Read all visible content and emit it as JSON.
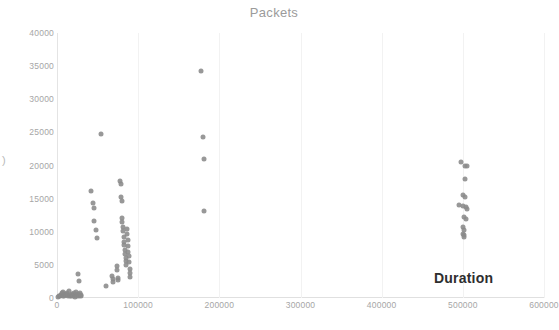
{
  "title": "Packets",
  "top_ghost": {
    "fragment_left": "",
    "fragment_right": ""
  },
  "stray_glyph": ")",
  "axis_title_x": "Duration",
  "colors": {
    "point": "#8a8a8a",
    "gridline": "#f2f2f2",
    "axis": "#e0e0e0",
    "tick_label": "#a6a6a6",
    "title": "#9b9b9b",
    "axis_title": "#2e2e2e"
  },
  "y_ticks": [
    "0",
    "5000",
    "10000",
    "15000",
    "20000",
    "25000",
    "30000",
    "35000",
    "40000"
  ],
  "x_ticks": [
    "0",
    "100000",
    "200000",
    "300000",
    "400000",
    "500000",
    "600000"
  ],
  "chart_data": {
    "type": "scatter",
    "title": "Packets",
    "xlabel": "Duration",
    "ylabel": "",
    "xlim": [
      0,
      600000
    ],
    "ylim": [
      0,
      40000
    ],
    "xticks": [
      0,
      100000,
      200000,
      300000,
      400000,
      500000,
      600000
    ],
    "yticks": [
      0,
      5000,
      10000,
      15000,
      20000,
      25000,
      30000,
      35000,
      40000
    ],
    "grid": "vertical-only",
    "legend": "none",
    "series": [
      {
        "name": "Packets vs Duration",
        "marker": "circle",
        "color": "#8a8a8a",
        "points": [
          [
            1000,
            200
          ],
          [
            2500,
            300
          ],
          [
            3500,
            250
          ],
          [
            4500,
            500
          ],
          [
            5500,
            400
          ],
          [
            6500,
            700
          ],
          [
            7500,
            350
          ],
          [
            8000,
            900
          ],
          [
            9000,
            250
          ],
          [
            10000,
            600
          ],
          [
            11000,
            400
          ],
          [
            12000,
            800
          ],
          [
            13000,
            300
          ],
          [
            14000,
            500
          ],
          [
            15000,
            1100
          ],
          [
            16000,
            350
          ],
          [
            17000,
            250
          ],
          [
            18000,
            450
          ],
          [
            19000,
            600
          ],
          [
            20000,
            300
          ],
          [
            21000,
            700
          ],
          [
            22000,
            200
          ],
          [
            23000,
            400
          ],
          [
            24000,
            900
          ],
          [
            25000,
            350
          ],
          [
            26000,
            550
          ],
          [
            27000,
            250
          ],
          [
            28000,
            800
          ],
          [
            29000,
            300
          ],
          [
            30000,
            450
          ],
          [
            26000,
            3600
          ],
          [
            27500,
            2600
          ],
          [
            42000,
            16200
          ],
          [
            44000,
            14300
          ],
          [
            45500,
            13600
          ],
          [
            46000,
            11600
          ],
          [
            47500,
            10200
          ],
          [
            49000,
            9000
          ],
          [
            54000,
            24800
          ],
          [
            60000,
            1800
          ],
          [
            68000,
            3300
          ],
          [
            68500,
            2900
          ],
          [
            69000,
            2400
          ],
          [
            74000,
            4800
          ],
          [
            74500,
            4200
          ],
          [
            75000,
            3000
          ],
          [
            75500,
            2700
          ],
          [
            78000,
            17600
          ],
          [
            78500,
            17200
          ],
          [
            79000,
            15300
          ],
          [
            79500,
            14700
          ],
          [
            80000,
            12100
          ],
          [
            80500,
            11500
          ],
          [
            81000,
            10700
          ],
          [
            81500,
            10100
          ],
          [
            82000,
            9200
          ],
          [
            82500,
            8500
          ],
          [
            83000,
            8000
          ],
          [
            83500,
            7300
          ],
          [
            84000,
            6700
          ],
          [
            84500,
            6100
          ],
          [
            85000,
            5600
          ],
          [
            85500,
            5000
          ],
          [
            86000,
            10400
          ],
          [
            86500,
            9600
          ],
          [
            87000,
            8800
          ],
          [
            87500,
            7800
          ],
          [
            88000,
            7000
          ],
          [
            88500,
            6400
          ],
          [
            89000,
            5400
          ],
          [
            89500,
            4400
          ],
          [
            90000,
            3700
          ],
          [
            90500,
            3200
          ],
          [
            178000,
            34300
          ],
          [
            180000,
            24300
          ],
          [
            180500,
            21000
          ],
          [
            181000,
            13200
          ],
          [
            498000,
            20500
          ],
          [
            503000,
            20000
          ],
          [
            505500,
            19900
          ],
          [
            503000,
            17900
          ],
          [
            500500,
            15600
          ],
          [
            502500,
            15300
          ],
          [
            495000,
            14000
          ],
          [
            500000,
            13900
          ],
          [
            503500,
            13700
          ],
          [
            505000,
            13500
          ],
          [
            502000,
            12200
          ],
          [
            503500,
            11900
          ],
          [
            500000,
            10700
          ],
          [
            501500,
            10300
          ],
          [
            500500,
            9600
          ],
          [
            502000,
            9500
          ],
          [
            501000,
            9200
          ]
        ]
      }
    ]
  }
}
